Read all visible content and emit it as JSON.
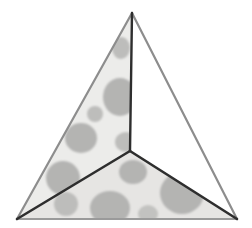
{
  "figure": {
    "name": "tetrahedron-three-faces",
    "canvas": {
      "width": 252,
      "height": 228,
      "background": "#ffffff"
    },
    "palette": {
      "face_fill": "#ececea",
      "face_fill_bottom": "#e6e5e3",
      "white_face": "#ffffff",
      "spot_fill": "#b4b4b2",
      "spot_fill_soft": "#bdbdbb",
      "outer_edge": "#8d8d8d",
      "inner_edge": "#2e2e2e",
      "base_edge": "#9a9a9a"
    },
    "vertices": [
      {
        "id": "apex",
        "label": "apex",
        "x": 132,
        "y": 13
      },
      {
        "id": "bottom-left",
        "label": "bottom left",
        "x": 17,
        "y": 219
      },
      {
        "id": "bottom-right",
        "label": "bottom right",
        "x": 237,
        "y": 219
      },
      {
        "id": "center",
        "label": "center",
        "x": 130,
        "y": 151
      }
    ],
    "faces": [
      {
        "id": "left-face",
        "label": "left face",
        "points": "132,13 17,219 130,151",
        "fill": "#ececea",
        "textured": true
      },
      {
        "id": "bottom-face",
        "label": "bottom face",
        "points": "17,219 237,219 130,151",
        "fill": "#e6e5e3",
        "textured": true
      },
      {
        "id": "right-face",
        "label": "right face",
        "points": "132,13 237,219 130,151",
        "fill": "#ffffff",
        "textured": false
      }
    ],
    "edges": [
      {
        "id": "edge-apex-bottom-left",
        "label": "apex to bottom left",
        "x1": 132,
        "y1": 13,
        "x2": 17,
        "y2": 219,
        "stroke": "#8d8d8d",
        "width": 2.2
      },
      {
        "id": "edge-apex-bottom-right",
        "label": "apex to bottom right",
        "x1": 132,
        "y1": 13,
        "x2": 237,
        "y2": 219,
        "stroke": "#8d8d8d",
        "width": 2.2
      },
      {
        "id": "edge-bottom-baseline",
        "label": "base line",
        "x1": 17,
        "y1": 219,
        "x2": 237,
        "y2": 219,
        "stroke": "#9a9a9a",
        "width": 2.0
      },
      {
        "id": "edge-apex-center",
        "label": "apex to center",
        "x1": 132,
        "y1": 13,
        "x2": 130,
        "y2": 151,
        "stroke": "#2e2e2e",
        "width": 2.4
      },
      {
        "id": "edge-center-bottom-left",
        "label": "center to bottom left",
        "x1": 130,
        "y1": 151,
        "x2": 17,
        "y2": 219,
        "stroke": "#2e2e2e",
        "width": 2.6
      },
      {
        "id": "edge-center-bottom-right",
        "label": "center to bottom right",
        "x1": 130,
        "y1": 151,
        "x2": 237,
        "y2": 219,
        "stroke": "#2e2e2e",
        "width": 2.6
      }
    ],
    "spots_left_face": [
      {
        "cx": 121,
        "cy": 48,
        "rx": 9,
        "ry": 11,
        "fill": "#bdbdbb"
      },
      {
        "cx": 120,
        "cy": 97,
        "rx": 17,
        "ry": 19,
        "fill": "#b4b4b2"
      },
      {
        "cx": 95,
        "cy": 114,
        "rx": 8,
        "ry": 8,
        "fill": "#bdbdbb"
      },
      {
        "cx": 81,
        "cy": 138,
        "rx": 16,
        "ry": 15,
        "fill": "#b4b4b2"
      },
      {
        "cx": 63,
        "cy": 178,
        "rx": 17,
        "ry": 17,
        "fill": "#b4b4b2"
      },
      {
        "cx": 126,
        "cy": 142,
        "rx": 11,
        "ry": 10,
        "fill": "#bdbdbb"
      }
    ],
    "spots_bottom_face": [
      {
        "cx": 133,
        "cy": 172,
        "rx": 14,
        "ry": 12,
        "fill": "#b4b4b2"
      },
      {
        "cx": 182,
        "cy": 193,
        "rx": 22,
        "ry": 21,
        "fill": "#b4b4b2"
      },
      {
        "cx": 110,
        "cy": 208,
        "rx": 20,
        "ry": 17,
        "fill": "#b4b4b2"
      },
      {
        "cx": 66,
        "cy": 204,
        "rx": 12,
        "ry": 12,
        "fill": "#bdbdbb"
      },
      {
        "cx": 148,
        "cy": 214,
        "rx": 10,
        "ry": 9,
        "fill": "#c2c2c0"
      }
    ]
  }
}
